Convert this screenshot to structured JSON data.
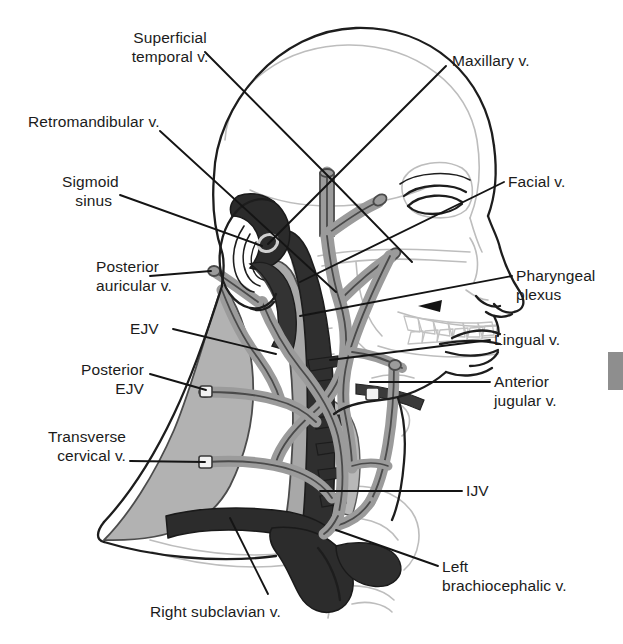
{
  "figure": {
    "type": "anatomical-diagram",
    "colors": {
      "background": "#ffffff",
      "vein_fill": "#9b9b9b",
      "vein_outline": "#3a3a3a",
      "deep_vein_fill": "#2e2e2e",
      "muscle_fill": "#b3b3b3",
      "muscle_outline": "#4a4a4a",
      "skull_outline": "#b9b9b9",
      "skin_outline": "#1d1d1d",
      "leader_line": "#141414",
      "text": "#1b1b1b",
      "edge_tab": "#8e8e8e"
    }
  },
  "labels": {
    "superficial_temporal": "Superficial\ntemporal v.",
    "retromandibular": "Retromandibular v.",
    "sigmoid_sinus": "Sigmoid\nsinus",
    "posterior_auricular": "Posterior\nauricular v.",
    "ejv": "EJV",
    "posterior_ejv": "Posterior\nEJV",
    "transverse_cervical": "Transverse\ncervical v.",
    "right_subclavian": "Right subclavian v.",
    "maxillary": "Maxillary v.",
    "facial": "Facial v.",
    "pharyngeal_plexus": "Pharyngeal\nplexus",
    "lingual": "Lingual v.",
    "anterior_jugular": "Anterior\njugular v.",
    "ijv": "IJV",
    "left_brachiocephalic": "Left\nbrachiocephalic v."
  },
  "label_positions": {
    "superficial_temporal": {
      "x": 104,
      "y": 28,
      "align": "left",
      "w": 130
    },
    "retromandibular": {
      "x": 28,
      "y": 112,
      "align": "left",
      "w": 180
    },
    "sigmoid_sinus": {
      "x": 62,
      "y": 172,
      "align": "left",
      "w": 100
    },
    "posterior_auricular": {
      "x": 96,
      "y": 257,
      "align": "left",
      "w": 120
    },
    "ejv": {
      "x": 130,
      "y": 319,
      "align": "left",
      "w": 42
    },
    "posterior_ejv": {
      "x": 58,
      "y": 360,
      "align": "left",
      "w": 100
    },
    "transverse_cervical": {
      "x": 18,
      "y": 427,
      "align": "left",
      "w": 120
    },
    "right_subclavian": {
      "x": 150,
      "y": 602,
      "align": "left",
      "w": 180
    },
    "maxillary": {
      "x": 452,
      "y": 51,
      "align": "left",
      "w": 130
    },
    "facial": {
      "x": 508,
      "y": 172,
      "align": "left",
      "w": 90
    },
    "pharyngeal_plexus": {
      "x": 516,
      "y": 266,
      "align": "left",
      "w": 110
    },
    "lingual": {
      "x": 494,
      "y": 330,
      "align": "left",
      "w": 100
    },
    "anterior_jugular": {
      "x": 494,
      "y": 372,
      "align": "left",
      "w": 110
    },
    "ijv": {
      "x": 466,
      "y": 481,
      "align": "left",
      "w": 40
    },
    "left_brachiocephalic": {
      "x": 442,
      "y": 557,
      "align": "left",
      "w": 170
    }
  },
  "edge_tab": {
    "x": 608,
    "y": 352,
    "w": 15,
    "h": 38
  }
}
